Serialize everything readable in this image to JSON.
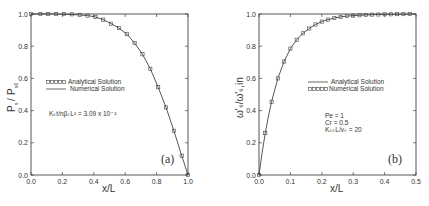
{
  "chart_data": [
    {
      "type": "line",
      "panel_label": "(a)",
      "title": "",
      "xlabel": "x/L",
      "ylabel": "P_s / P_s0",
      "xlim": [
        0.0,
        1.0
      ],
      "ylim": [
        0.0,
        1.0
      ],
      "xticks": [
        "0.0",
        "0.2",
        "0.4",
        "0.6",
        "0.8",
        "1.0"
      ],
      "yticks": [
        "0.0",
        "0.2",
        "0.4",
        "0.6",
        "0.8",
        "1.0"
      ],
      "grid": false,
      "legend": [
        {
          "label": "Analytical Solution",
          "style": "markers"
        },
        {
          "label": "Numerical Solution",
          "style": "line"
        }
      ],
      "annotation": "K_s t / n β_s L² = 3.09 × 10⁻²",
      "series": [
        {
          "name": "Numerical Solution",
          "style": "line",
          "x": [
            0.0,
            0.1,
            0.2,
            0.3,
            0.36,
            0.41,
            0.46,
            0.51,
            0.56,
            0.61,
            0.66,
            0.71,
            0.76,
            0.81,
            0.86,
            0.91,
            0.96,
            1.0
          ],
          "y": [
            1.0,
            1.0,
            0.999,
            0.995,
            0.99,
            0.982,
            0.965,
            0.94,
            0.912,
            0.875,
            0.82,
            0.75,
            0.66,
            0.545,
            0.42,
            0.275,
            0.12,
            0.0
          ]
        },
        {
          "name": "Analytical Solution",
          "style": "markers",
          "x": [
            0.0,
            0.06,
            0.11,
            0.16,
            0.21,
            0.26,
            0.31,
            0.36,
            0.41,
            0.46,
            0.51,
            0.56,
            0.61,
            0.66,
            0.71,
            0.76,
            0.81,
            0.86,
            0.91,
            0.96,
            1.0
          ],
          "y": [
            1.0,
            1.0,
            1.0,
            1.0,
            1.0,
            0.998,
            0.995,
            0.99,
            0.982,
            0.965,
            0.94,
            0.912,
            0.875,
            0.82,
            0.75,
            0.66,
            0.545,
            0.42,
            0.275,
            0.12,
            0.0
          ]
        }
      ]
    },
    {
      "type": "line",
      "panel_label": "(b)",
      "title": "",
      "xlabel": "x/L",
      "ylabel": "ω'_s / ω'_s,in",
      "xlim": [
        0.0,
        0.5
      ],
      "ylim": [
        0.0,
        1.0
      ],
      "xticks": [
        "0.0",
        "0.1",
        "0.2",
        "0.3",
        "0.4",
        "0.5"
      ],
      "yticks": [
        "0.0",
        "0.2",
        "0.4",
        "0.6",
        "0.8",
        "1.0"
      ],
      "grid": false,
      "legend": [
        {
          "label": "Analytical Solution",
          "style": "line"
        },
        {
          "label": "Numerical Solution",
          "style": "markers"
        }
      ],
      "annotation_lines": [
        "Pe = 1",
        "Cr = 0.5",
        "K_ss L / v_s = 20"
      ],
      "series": [
        {
          "name": "Analytical Solution",
          "style": "line",
          "x": [
            0.0,
            0.01,
            0.02,
            0.03,
            0.04,
            0.06,
            0.08,
            0.1,
            0.12,
            0.14,
            0.16,
            0.18,
            0.2,
            0.22,
            0.24,
            0.26,
            0.28,
            0.3,
            0.34,
            0.38,
            0.42,
            0.46,
            0.5
          ],
          "y": [
            0.0,
            0.14,
            0.26,
            0.365,
            0.455,
            0.6,
            0.705,
            0.785,
            0.84,
            0.88,
            0.91,
            0.935,
            0.953,
            0.965,
            0.975,
            0.982,
            0.987,
            0.99,
            0.994,
            0.997,
            0.998,
            0.999,
            1.0
          ]
        },
        {
          "name": "Numerical Solution",
          "style": "markers",
          "x": [
            0.0,
            0.02,
            0.04,
            0.06,
            0.08,
            0.1,
            0.12,
            0.14,
            0.16,
            0.18,
            0.2,
            0.22,
            0.24,
            0.26,
            0.28,
            0.3,
            0.32,
            0.34,
            0.36,
            0.38,
            0.4,
            0.42,
            0.44,
            0.46,
            0.48
          ],
          "y": [
            0.0,
            0.26,
            0.455,
            0.6,
            0.705,
            0.785,
            0.84,
            0.88,
            0.91,
            0.935,
            0.953,
            0.965,
            0.975,
            0.982,
            0.987,
            0.99,
            0.992,
            0.994,
            0.996,
            0.997,
            0.998,
            0.998,
            0.999,
            0.999,
            1.0
          ]
        }
      ]
    }
  ],
  "panels": {
    "a": {
      "tag": "(a)",
      "xlabel": "x/L",
      "ylabel_num": "P",
      "ylabel_num_sub": "s",
      "ylabel_den": "P",
      "ylabel_den_sub": "s0",
      "legend_markers": "Analytical Solution",
      "legend_line": "Numerical Solution",
      "annotation": "K",
      "annotation_full": "Kₛt/nβₛL²  =  3.09  x  10⁻²"
    },
    "b": {
      "tag": "(b)",
      "xlabel": "x/L",
      "ylabel": "ω'ₛ/ω'ₛ,in",
      "legend_line": "Analytical Solution",
      "legend_markers": "Numerical Solution",
      "note_pe": "Pe  =  1",
      "note_cr": "Cr  =  0.5",
      "note_k": "KₛₛL/vₛ  =  20"
    }
  }
}
